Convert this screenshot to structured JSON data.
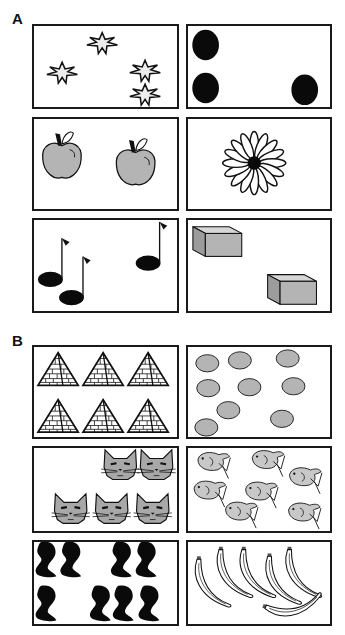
{
  "figure": {
    "sections": [
      {
        "label": "A",
        "panels": [
          {
            "id": "stars",
            "item": "star",
            "count": 4
          },
          {
            "id": "dots",
            "item": "black-oval",
            "count": 3
          },
          {
            "id": "apples",
            "item": "apple",
            "count": 2
          },
          {
            "id": "flower",
            "item": "daisy-flower",
            "count": 1
          },
          {
            "id": "notes",
            "item": "music-note",
            "count": 3
          },
          {
            "id": "boxes",
            "item": "box",
            "count": 2
          }
        ]
      },
      {
        "label": "B",
        "panels": [
          {
            "id": "pyramids",
            "item": "pyramid",
            "count": 6
          },
          {
            "id": "gray-ovals",
            "item": "gray-oval",
            "count": 9
          },
          {
            "id": "cats",
            "item": "cat-face",
            "count": 5
          },
          {
            "id": "fish",
            "item": "fish",
            "count": 7
          },
          {
            "id": "black-shapes",
            "item": "black-abstract-shape",
            "count": 10
          },
          {
            "id": "bananas",
            "item": "banana",
            "count": 6
          }
        ]
      }
    ],
    "colors": {
      "border": "#1a1a1a",
      "gray_fill": "#b4b4b4",
      "light_fill": "#e8e8e8",
      "black": "#0a0a0a"
    }
  }
}
